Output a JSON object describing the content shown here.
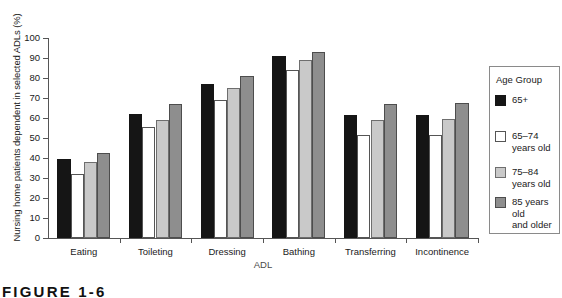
{
  "chart_data": {
    "type": "bar",
    "title": "",
    "xlabel": "ADL",
    "ylabel": "Nursing home patients dependent in selected ADLs (%)",
    "ylim": [
      0,
      100
    ],
    "yticks": [
      0,
      10,
      20,
      30,
      40,
      50,
      60,
      70,
      80,
      90,
      100
    ],
    "grid": false,
    "legend_position": "right",
    "legend_title": "Age Group",
    "categories": [
      "Eating",
      "Toileting",
      "Dressing",
      "Bathing",
      "Transferring",
      "Incontinence"
    ],
    "series": [
      {
        "name": "65+",
        "color": "#151515",
        "values": [
          39.5,
          62,
          77,
          91,
          61.5,
          61.5
        ]
      },
      {
        "name": "65–74 years old",
        "color": "#ffffff",
        "values": [
          32,
          55.5,
          69,
          84,
          51.5,
          51.5
        ]
      },
      {
        "name": "75–84 years old",
        "color": "#c9c9c9",
        "values": [
          38,
          59,
          75,
          89,
          59,
          59.5
        ]
      },
      {
        "name": "85 years old and older",
        "color": "#8e8e8e",
        "values": [
          42.5,
          67,
          81,
          93,
          67,
          67.5
        ]
      }
    ]
  },
  "legend": {
    "title": "Age Group",
    "entries": [
      {
        "label": "65+"
      },
      {
        "label": "65–74\nyears old"
      },
      {
        "label": "75–84\nyears old"
      },
      {
        "label": "85 years old\nand older"
      }
    ]
  },
  "axes": {
    "ylabel": "Nursing home patients dependent in selected ADLs (%)",
    "xlabel": "ADL",
    "yticks": [
      "0",
      "10",
      "20",
      "30",
      "40",
      "50",
      "60",
      "70",
      "80",
      "90",
      "100"
    ],
    "xticks": [
      "Eating",
      "Toileting",
      "Dressing",
      "Bathing",
      "Transferring",
      "Incontinence"
    ]
  },
  "caption": {
    "text": "FIGURE 1-6"
  }
}
